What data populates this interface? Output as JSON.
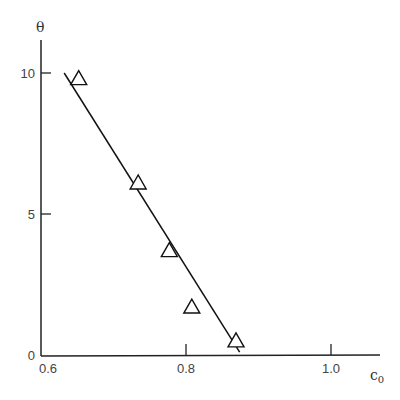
{
  "chart_data": {
    "type": "scatter",
    "title": "",
    "xlabel": "c₀",
    "ylabel": "θ",
    "xlim": [
      0.6,
      1.08
    ],
    "ylim": [
      0,
      10.2
    ],
    "x_ticks": [
      0.6,
      0.8,
      1.0
    ],
    "x_tick_labels": [
      "0.6",
      "0.8",
      "1.0"
    ],
    "y_ticks": [
      0,
      5,
      10
    ],
    "y_tick_labels": [
      "0",
      "5",
      "10"
    ],
    "grid": false,
    "legend": null,
    "series": [
      {
        "name": "data",
        "marker": "triangle-open",
        "x": [
          0.652,
          0.734,
          0.777,
          0.808,
          0.869
        ],
        "y": [
          9.8,
          6.1,
          3.7,
          1.7,
          0.5
        ]
      },
      {
        "name": "fit line",
        "type": "line",
        "x": [
          0.632,
          0.874
        ],
        "y": [
          10.0,
          0.1
        ]
      }
    ]
  },
  "axes": {
    "x_label_main": "c",
    "x_label_sub": "0",
    "y_label": "θ"
  },
  "colors": {
    "axis": "#222222",
    "marker": "#111111",
    "line": "#111111"
  }
}
